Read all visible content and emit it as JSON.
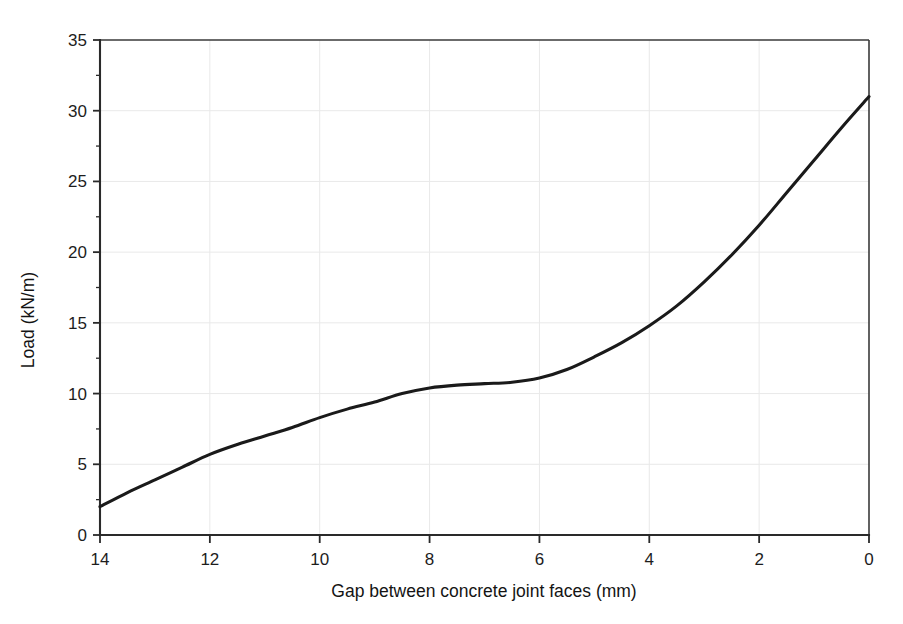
{
  "chart_data": {
    "type": "line",
    "title": "",
    "subtitle": "",
    "xlabel": "Gap between concrete joint faces (mm)",
    "ylabel": "Load (kN/m)",
    "xlim": [
      14,
      0
    ],
    "ylim": [
      0,
      35
    ],
    "x_reversed": true,
    "grid": true,
    "legend": null,
    "legend_position": "none",
    "xticks": [
      14,
      12,
      10,
      8,
      6,
      4,
      2,
      0
    ],
    "xtick_labels": [
      "14",
      "12",
      "10",
      "8",
      "6",
      "4",
      "2",
      "0"
    ],
    "yticks": [
      0,
      5,
      10,
      15,
      20,
      25,
      30,
      35
    ],
    "ytick_labels": [
      "0",
      "5",
      "10",
      "15",
      "20",
      "25",
      "30",
      "35"
    ],
    "series": [
      {
        "name": "Load",
        "color": "#1a1a1a",
        "x": [
          14.0,
          13.5,
          13.0,
          12.5,
          12.0,
          11.5,
          11.0,
          10.5,
          10.0,
          9.5,
          9.0,
          8.5,
          8.0,
          7.5,
          7.0,
          6.5,
          6.0,
          5.5,
          5.0,
          4.5,
          4.0,
          3.5,
          3.0,
          2.5,
          2.0,
          1.5,
          1.0,
          0.5,
          0.0
        ],
        "values": [
          2.0,
          3.0,
          3.9,
          4.8,
          5.7,
          6.4,
          7.0,
          7.6,
          8.3,
          8.9,
          9.4,
          10.0,
          10.4,
          10.6,
          10.7,
          10.8,
          11.1,
          11.7,
          12.6,
          13.6,
          14.8,
          16.2,
          17.9,
          19.8,
          21.9,
          24.2,
          26.5,
          28.8,
          31.0
        ]
      }
    ],
    "annotations": []
  },
  "axes": {
    "x_axis_title": "Gap between concrete joint faces (mm)",
    "y_axis_title": "Load (kN/m)"
  },
  "colors": {
    "curve": "#1a1a1a",
    "axis": "#2a2a2a",
    "grid": "#e9e9e9",
    "background": "#ffffff",
    "text": "#1d1d1d"
  }
}
